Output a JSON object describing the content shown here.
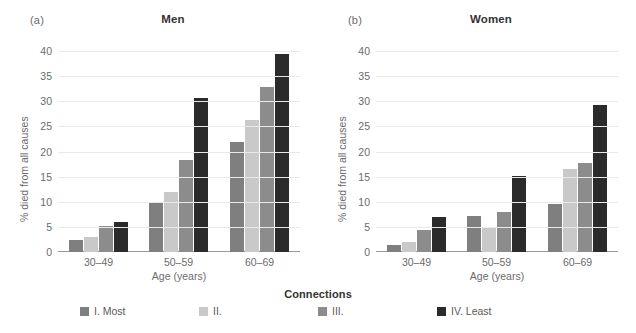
{
  "figure": {
    "panels": [
      {
        "letter": "(a)",
        "title": "Men"
      },
      {
        "letter": "(b)",
        "title": "Women"
      }
    ],
    "axis": {
      "ylabel": "% died from all causes",
      "xlabel": "Age (years)",
      "yticks": [
        "40",
        "35",
        "30",
        "25",
        "20",
        "15",
        "10",
        "5",
        "0"
      ],
      "xticks": [
        "30–49",
        "50–59",
        "60–69"
      ]
    },
    "legend": {
      "title": "Connections",
      "items": [
        {
          "label": "I. Most",
          "color": "#7f7f7f"
        },
        {
          "label": "II.",
          "color": "#c9c9c9"
        },
        {
          "label": "III.",
          "color": "#8c8c8c"
        },
        {
          "label": "IV. Least",
          "color": "#2b2b2b"
        }
      ]
    }
  },
  "chart_data": [
    {
      "type": "bar",
      "title": "Men",
      "panel": "(a)",
      "xlabel": "Age (years)",
      "ylabel": "% died from all causes",
      "categories": [
        "30–49",
        "50–59",
        "60–69"
      ],
      "ylim": [
        0,
        40
      ],
      "yticks": [
        0,
        5,
        10,
        15,
        20,
        25,
        30,
        35,
        40
      ],
      "grid": true,
      "legend_position": "bottom-center",
      "series": [
        {
          "name": "I. Most",
          "color": "#7f7f7f",
          "values": [
            2.3,
            9.7,
            21.8
          ]
        },
        {
          "name": "II.",
          "color": "#c9c9c9",
          "values": [
            3.0,
            12.0,
            26.3
          ]
        },
        {
          "name": "III.",
          "color": "#8c8c8c",
          "values": [
            5.1,
            18.3,
            32.8
          ]
        },
        {
          "name": "IV. Least",
          "color": "#2b2b2b",
          "values": [
            6.0,
            30.7,
            39.4
          ]
        }
      ]
    },
    {
      "type": "bar",
      "title": "Women",
      "panel": "(b)",
      "xlabel": "Age (years)",
      "ylabel": "% died from all causes",
      "categories": [
        "30–49",
        "50–59",
        "60–69"
      ],
      "ylim": [
        0,
        40
      ],
      "yticks": [
        0,
        5,
        10,
        15,
        20,
        25,
        30,
        35,
        40
      ],
      "grid": true,
      "legend_position": "bottom-center",
      "series": [
        {
          "name": "I. Most",
          "color": "#7f7f7f",
          "values": [
            1.4,
            7.2,
            9.6
          ]
        },
        {
          "name": "II.",
          "color": "#c9c9c9",
          "values": [
            1.9,
            4.9,
            16.6
          ]
        },
        {
          "name": "III.",
          "color": "#8c8c8c",
          "values": [
            4.3,
            7.9,
            17.7
          ]
        },
        {
          "name": "IV. Least",
          "color": "#2b2b2b",
          "values": [
            6.9,
            15.2,
            29.2
          ]
        }
      ]
    }
  ]
}
